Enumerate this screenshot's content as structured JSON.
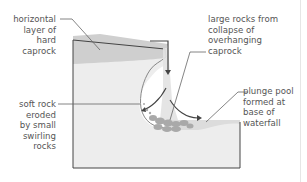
{
  "labels": {
    "caprock": [
      "horizontal",
      "layer of",
      "hard",
      "caprock"
    ],
    "large_rocks": [
      "large rocks from",
      "collapse of",
      "overhanging",
      "caprock"
    ],
    "soft_rock": [
      "soft rock",
      "eroded",
      "by small",
      "swirling",
      "rocks"
    ],
    "plunge_pool": [
      "plunge pool",
      "formed at",
      "base of",
      "waterfall"
    ]
  },
  "colors": {
    "soft_rock": "#ededed",
    "caprock": "#cfcfcf",
    "water": "#dcdcdc",
    "rocks": "#a9a9a9",
    "outline": "#444444",
    "leader": "#666666",
    "text": "#555555"
  }
}
